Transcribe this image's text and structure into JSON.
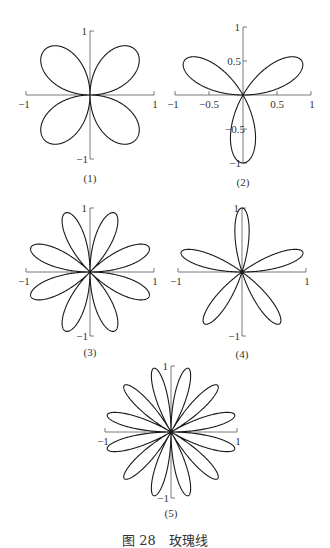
{
  "chart_data": [
    {
      "type": "line",
      "title": "(1)",
      "equation": "r = sin 2θ",
      "n": 2,
      "petals": 4,
      "xlim": [
        -1,
        1
      ],
      "ylim": [
        -1,
        1
      ],
      "x_ticks": [
        "-1",
        "1"
      ],
      "y_ticks": [
        "1",
        "-1"
      ],
      "grid": false
    },
    {
      "type": "line",
      "title": "(2)",
      "equation": "r = sin 3θ",
      "n": 3,
      "petals": 3,
      "xlim": [
        -1,
        1
      ],
      "ylim": [
        -1,
        1
      ],
      "x_ticks": [
        "-1",
        "-0.5",
        "0.5",
        "1"
      ],
      "y_ticks": [
        "1",
        "0.5",
        "-0.5",
        "-1"
      ],
      "grid": false
    },
    {
      "type": "line",
      "title": "(3)",
      "equation": "r = sin 4θ",
      "n": 4,
      "petals": 8,
      "xlim": [
        -1,
        1
      ],
      "ylim": [
        -1,
        1
      ],
      "x_ticks": [
        "-1",
        "1"
      ],
      "y_ticks": [
        "1",
        "-1"
      ],
      "grid": false
    },
    {
      "type": "line",
      "title": "(4)",
      "equation": "r = sin 5θ",
      "n": 5,
      "petals": 5,
      "xlim": [
        -1,
        1
      ],
      "ylim": [
        -1,
        1
      ],
      "x_ticks": [
        "-1",
        "1"
      ],
      "y_ticks": [
        "1",
        "-1"
      ],
      "grid": false
    },
    {
      "type": "line",
      "title": "(5)",
      "equation": "r = sin 6θ",
      "n": 6,
      "petals": 12,
      "xlim": [
        -1,
        1
      ],
      "ylim": [
        -1,
        1
      ],
      "x_ticks": [
        "-1",
        "1"
      ],
      "y_ticks": [
        "1",
        "-1"
      ],
      "grid": false
    }
  ],
  "figure": {
    "caption": "图 28　玫瑰线",
    "line_color": "#1a1a1a",
    "axis_color": "#555555"
  },
  "plots": [
    {
      "label": "(1)",
      "cx": 90,
      "cy": 95,
      "r": 64,
      "n": 2,
      "label_y": 182,
      "ticks": {
        "xneg": "-1",
        "xpos": "1",
        "ypos": "1",
        "yneg": "-1"
      }
    },
    {
      "label": "(2)",
      "cx": 243,
      "cy": 95,
      "r": 68,
      "n": 3,
      "label_y": 186,
      "ticks": {
        "xneg": "-1",
        "xpos": "1",
        "ypos": "1",
        "yneg": "-1",
        "xneg_half": "-0.5",
        "xpos_half": "0.5",
        "ypos_half": "0.5",
        "yneg_half": "-0.5"
      }
    },
    {
      "label": "(3)",
      "cx": 90,
      "cy": 272,
      "r": 64,
      "n": 4,
      "label_y": 356,
      "ticks": {
        "xneg": "-1",
        "xpos": "1",
        "ypos": "1",
        "yneg": "-1"
      }
    },
    {
      "label": "(4)",
      "cx": 242,
      "cy": 272,
      "r": 64,
      "n": 5,
      "label_y": 358,
      "ticks": {
        "xneg": "-1",
        "xpos": "1",
        "ypos": "1",
        "yneg": "-1"
      }
    },
    {
      "label": "(5)",
      "cx": 171,
      "cy": 432,
      "r": 66,
      "n": 6,
      "label_y": 517,
      "ticks": {
        "xneg": "-1",
        "xpos": "1",
        "ypos": "1",
        "yneg": "-1"
      }
    }
  ]
}
